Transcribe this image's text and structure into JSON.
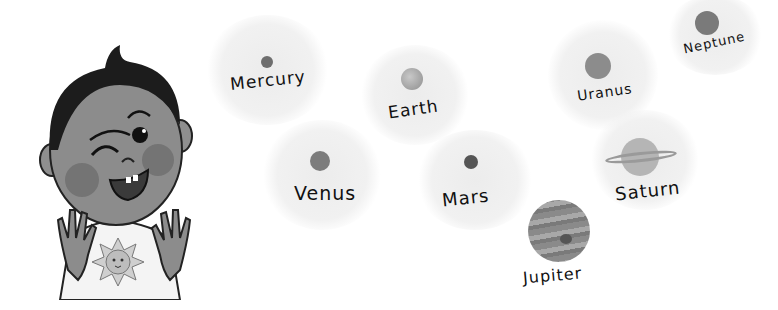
{
  "illustration": {
    "style": "grayscale children's illustration",
    "character": "winking boy with raised hands and sun t-shirt",
    "planets": [
      {
        "name": "Mercury",
        "x": 267,
        "y": 62,
        "size": 12,
        "color": "#6e6e6e",
        "label_x": 230,
        "label_y": 70,
        "rotate": -6
      },
      {
        "name": "Earth",
        "x": 412,
        "y": 79,
        "size": 22,
        "color": "#9a9a9a",
        "label_x": 388,
        "label_y": 100,
        "rotate": -8
      },
      {
        "name": "Uranus",
        "x": 598,
        "y": 66,
        "size": 26,
        "color": "#8c8c8c",
        "label_x": 577,
        "label_y": 84,
        "rotate": -8
      },
      {
        "name": "Neptune",
        "x": 707,
        "y": 23,
        "size": 24,
        "color": "#7a7a7a",
        "label_x": 683,
        "label_y": 34,
        "rotate": -12
      },
      {
        "name": "Venus",
        "x": 320,
        "y": 161,
        "size": 20,
        "color": "#7c7c7c",
        "label_x": 294,
        "label_y": 182,
        "rotate": 0
      },
      {
        "name": "Mars",
        "x": 471,
        "y": 162,
        "size": 14,
        "color": "#555555",
        "label_x": 442,
        "label_y": 188,
        "rotate": -6
      },
      {
        "name": "Saturn",
        "x": 639,
        "y": 157,
        "size": 38,
        "color": "#b0b0b0",
        "label_x": 615,
        "label_y": 180,
        "rotate": -6
      },
      {
        "name": "Jupiter",
        "x": 559,
        "y": 231,
        "size": 62,
        "color": "#8a8a8a",
        "label_x": 523,
        "label_y": 266,
        "rotate": -5
      }
    ]
  }
}
